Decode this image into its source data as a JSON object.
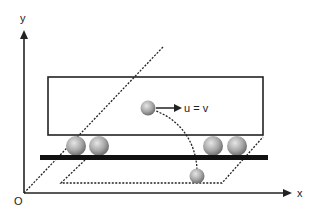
{
  "diagram": {
    "axes": {
      "y_label": "y",
      "x_label": "x",
      "origin_label": "O"
    },
    "velocity_label": "u = v",
    "colors": {
      "line": "#222222",
      "ball_light": "#d8d8d8",
      "ball_dark": "#7a7a7a",
      "background": "#ffffff"
    }
  }
}
